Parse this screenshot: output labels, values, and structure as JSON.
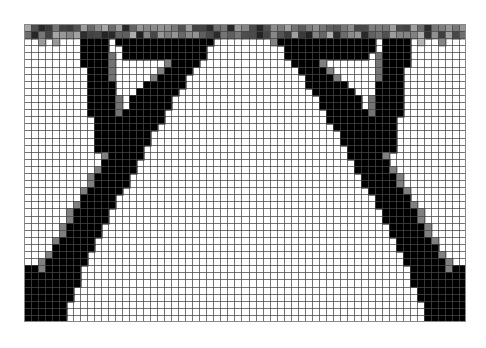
{
  "figure": {
    "title": "",
    "background_color": "#ffffff",
    "width": 486,
    "height": 348
  },
  "plot": {
    "name": "topology-optimization-density-field",
    "left": 24,
    "top": 24,
    "width": 442,
    "height": 298,
    "grid_visible": true,
    "grid_color": "#555555",
    "empty_color": "#ffffff",
    "solid_color": "#000000",
    "border_color": "#888888"
  },
  "chart_data": {
    "type": "heatmap",
    "title": "",
    "subtitle": "",
    "xlabel": "",
    "ylabel": "",
    "xticklabels": [],
    "yticklabels": [],
    "grid": true,
    "legend": "none",
    "colormap": "gray_reversed",
    "value_range": [
      0,
      1
    ],
    "value_label": "material density",
    "cols": 63,
    "rows": 42,
    "cell_px": 7.016,
    "features": {
      "deck_band_rows": [
        0,
        1
      ],
      "deck_band_mean_density": 0.55,
      "deck_band_speckle": true,
      "inner_leg_left_col": 8,
      "inner_leg_right_col": 54,
      "inner_v_apex_row": 17,
      "outer_arch_left_start_col": 19,
      "outer_arch_right_start_col": 43,
      "bottom_left_support_col": 0,
      "bottom_right_support_col": 62,
      "symmetry": "left-right mirror"
    },
    "geometry_polylines": {
      "note": "Normalized column index (0-62) of black-material boundaries per row (0 top, 41 bottom) for the left half; right half mirrored.",
      "inner_leg_left": [
        {
          "row": 2,
          "c0": 8,
          "c1": 11
        },
        {
          "row": 6,
          "c0": 8,
          "c1": 11
        },
        {
          "row": 10,
          "c0": 8,
          "c1": 11
        },
        {
          "row": 14,
          "c0": 9,
          "c1": 12
        },
        {
          "row": 17,
          "c0": 10,
          "c1": 13
        }
      ],
      "outer_arch_left": [
        {
          "row": 2,
          "c0": 14,
          "c1": 24
        },
        {
          "row": 5,
          "c0": 13,
          "c1": 20
        },
        {
          "row": 8,
          "c0": 12,
          "c1": 17
        },
        {
          "row": 12,
          "c0": 10,
          "c1": 15
        },
        {
          "row": 16,
          "c0": 8,
          "c1": 13
        },
        {
          "row": 20,
          "c0": 6,
          "c1": 11
        },
        {
          "row": 24,
          "c0": 4,
          "c1": 9
        },
        {
          "row": 28,
          "c0": 2,
          "c1": 7
        },
        {
          "row": 32,
          "c0": 1,
          "c1": 6
        },
        {
          "row": 36,
          "c0": 0,
          "c1": 4
        },
        {
          "row": 40,
          "c0": 0,
          "c1": 2
        }
      ]
    }
  }
}
